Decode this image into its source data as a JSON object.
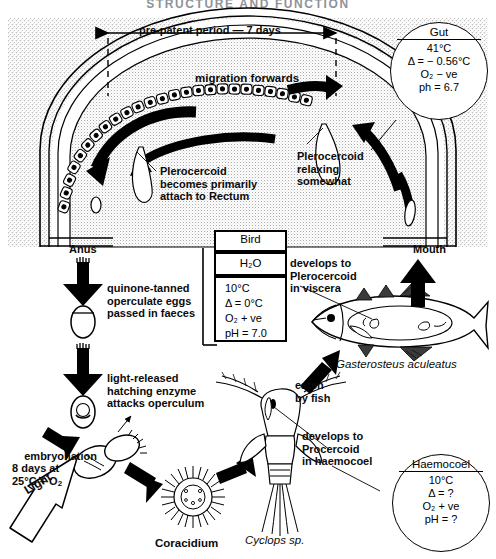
{
  "figure": {
    "title_partial": "STRUCTURE AND FUNCTION",
    "domain_note": "life-cycle diagram"
  },
  "annotations": {
    "prepatent": "pre-patent period — 7 days",
    "migration": "migration forwards",
    "plero_attach": "Plerocercoid\nbecomes primarily\nattach to Rectum",
    "plero_relax": "Plerocercoid\nrelaxing\nsomewhat",
    "anus": "Anus",
    "mouth": "Mouth",
    "eggs": "quinone-tanned\noperculate eggs\npassed in faeces",
    "hatching": "light-released\nhatching enzyme\nattacks operculum",
    "embryonation": "embryonation\n8 days at\n25°C + O",
    "embryonation_sub": "2",
    "light": "Light",
    "coracidium": "Coracidium",
    "cyclops": "Cyclops sp.",
    "procercoid": "develops to\nProcercoid\nin haemocoel",
    "eaten_by_fish": "eaten\nby fish",
    "plerocercoid_viscera": "develops to\nPlerocercoid\nin viscera",
    "fish_species": "Gasterosteus aculeatus"
  },
  "gut_circle": {
    "header": "Gut",
    "lines": [
      "41°C",
      "Δ = − 0.56°C",
      "O₂ − ve",
      "ph = 6.7"
    ]
  },
  "haemocoel_circle": {
    "header": "Haemocoel",
    "lines": [
      "10°C",
      "Δ = ?",
      "O₂ + ve",
      "pH = ?"
    ]
  },
  "bird_box": {
    "header": "Bird",
    "medium": "H₂O",
    "lines": [
      "10°C",
      "Δ = 0°C",
      "O₂ + ve",
      "pH = 7.0"
    ]
  },
  "colors": {
    "ink": "#000000",
    "paper": "#ffffff",
    "stipple": "#9a9a9a",
    "title": "#2f3a46"
  }
}
